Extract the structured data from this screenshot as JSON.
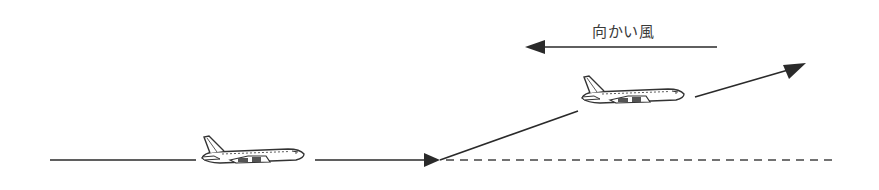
{
  "diagram": {
    "type": "aircraft-takeoff-headwind",
    "wind_label": "向かい風",
    "colors": {
      "line": "#2a2a2a",
      "plane_stroke": "#333333",
      "background": "#ffffff"
    },
    "elements": {
      "ground_run_segments": [
        {
          "x1": 50,
          "y1": 160,
          "x2": 196,
          "y2": 160
        },
        {
          "x1": 315,
          "y1": 160,
          "x2": 438,
          "y2": 160
        }
      ],
      "liftoff_point": {
        "x": 440,
        "y": 160
      },
      "climb_path": [
        {
          "x1": 440,
          "y1": 160,
          "x2": 578,
          "y2": 111
        },
        {
          "x1": 695,
          "y1": 97,
          "x2": 805,
          "y2": 64
        }
      ],
      "dashed_reference": {
        "x1": 442,
        "y1": 160,
        "x2": 835,
        "y2": 160
      },
      "headwind_arrow": {
        "x1": 717,
        "y1": 47,
        "x2": 527,
        "y2": 47,
        "direction": "left"
      },
      "planes": [
        {
          "name": "plane-on-ground",
          "x": 200,
          "y": 135
        },
        {
          "name": "plane-climbing",
          "x": 580,
          "y": 75
        }
      ]
    }
  }
}
